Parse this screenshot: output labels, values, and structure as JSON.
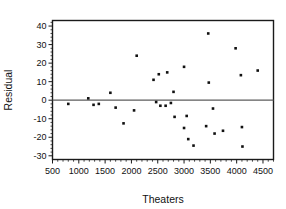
{
  "chart_data": {
    "type": "scatter",
    "title": "",
    "xlabel": "Theaters",
    "ylabel": "Residual",
    "xlim": [
      500,
      4700
    ],
    "ylim": [
      -32,
      43
    ],
    "xticks": [
      500,
      1000,
      1500,
      2000,
      2500,
      3000,
      3500,
      4000,
      4500
    ],
    "yticks": [
      -30,
      -20,
      -10,
      0,
      10,
      20,
      30,
      40
    ],
    "x_minor_tick_step": 100,
    "y_minor_tick_step": 2,
    "grid": false,
    "legend": null,
    "reference_line": {
      "orientation": "horizontal",
      "y": 0,
      "color": "#5c5c5c"
    },
    "marker": {
      "shape": "square",
      "size": 2.6,
      "color": "#111111"
    },
    "points": [
      {
        "x": 800,
        "y": -2
      },
      {
        "x": 1180,
        "y": 1
      },
      {
        "x": 1280,
        "y": -2.5
      },
      {
        "x": 1380,
        "y": -2
      },
      {
        "x": 1600,
        "y": 4
      },
      {
        "x": 1700,
        "y": -4
      },
      {
        "x": 1850,
        "y": -12.5
      },
      {
        "x": 2050,
        "y": -5.5
      },
      {
        "x": 2100,
        "y": 24
      },
      {
        "x": 2420,
        "y": 11
      },
      {
        "x": 2470,
        "y": -1
      },
      {
        "x": 2520,
        "y": 14
      },
      {
        "x": 2550,
        "y": -3
      },
      {
        "x": 2650,
        "y": -3
      },
      {
        "x": 2680,
        "y": 15
      },
      {
        "x": 2750,
        "y": -1.5
      },
      {
        "x": 2800,
        "y": 4.5
      },
      {
        "x": 2820,
        "y": -9
      },
      {
        "x": 3000,
        "y": 18
      },
      {
        "x": 3000,
        "y": -15
      },
      {
        "x": 3050,
        "y": -8.5
      },
      {
        "x": 3080,
        "y": -21
      },
      {
        "x": 3180,
        "y": -24.5
      },
      {
        "x": 3420,
        "y": -14
      },
      {
        "x": 3460,
        "y": 36
      },
      {
        "x": 3470,
        "y": 9.5
      },
      {
        "x": 3550,
        "y": -4.5
      },
      {
        "x": 3580,
        "y": -18
      },
      {
        "x": 3740,
        "y": -16.5
      },
      {
        "x": 3980,
        "y": 28
      },
      {
        "x": 4080,
        "y": 13.5
      },
      {
        "x": 4100,
        "y": -14.5
      },
      {
        "x": 4110,
        "y": -25
      },
      {
        "x": 4400,
        "y": 16
      }
    ]
  },
  "axes": {
    "y_tick_labels": [
      "40",
      "30",
      "20",
      "10",
      "0",
      "-10",
      "-20",
      "-30"
    ],
    "x_tick_labels": [
      "500",
      "1000",
      "1500",
      "2000",
      "2500",
      "3000",
      "3500",
      "4000",
      "4500"
    ],
    "x_title": "Theaters",
    "y_title": "Residual"
  }
}
